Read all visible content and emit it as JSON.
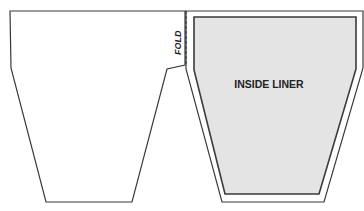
{
  "diagram": {
    "fold_label": "FOLD",
    "liner_label": "INSIDE LINER",
    "colors": {
      "outline": "#3a3a3a",
      "liner_fill": "#e4e4e4",
      "background": "#ffffff"
    }
  }
}
